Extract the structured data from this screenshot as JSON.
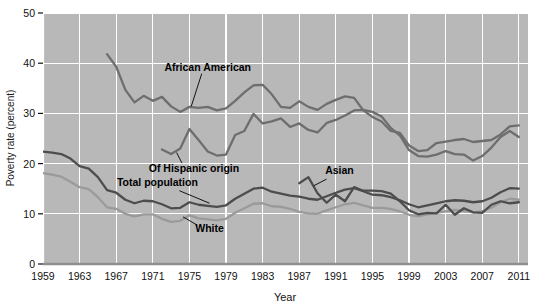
{
  "chart_data": {
    "type": "line",
    "title": "",
    "xlabel": "Year",
    "ylabel": "Poverty rate (percent)",
    "xlim": [
      1959,
      2012
    ],
    "ylim": [
      0,
      50
    ],
    "yticks": [
      0,
      10,
      20,
      30,
      40,
      50
    ],
    "ytick_labels": [
      "0",
      "10",
      "20",
      "30",
      "40",
      "50"
    ],
    "xticks": [
      1959,
      1963,
      1967,
      1971,
      1975,
      1979,
      1983,
      1987,
      1991,
      1995,
      1999,
      2003,
      2007,
      2011
    ],
    "xtick_labels": [
      "1959",
      "1963",
      "1967",
      "1971",
      "1975",
      "1979",
      "1983",
      "1987",
      "1991",
      "1995",
      "1999",
      "2003",
      "2007",
      "2011"
    ],
    "grid": true,
    "grid_color": "#ffffff",
    "plot_background": "#b8b8b8",
    "legend_position": "inline-annotations",
    "series": [
      {
        "name": "African American",
        "color": "#6e6e6e",
        "label_x": 1977,
        "label_y": 38.5,
        "x": [
          1966,
          1967,
          1968,
          1969,
          1970,
          1971,
          1972,
          1973,
          1974,
          1975,
          1976,
          1977,
          1978,
          1979,
          1980,
          1981,
          1982,
          1983,
          1984,
          1985,
          1986,
          1987,
          1988,
          1989,
          1990,
          1991,
          1992,
          1993,
          1994,
          1995,
          1996,
          1997,
          1998,
          1999,
          2000,
          2001,
          2002,
          2003,
          2004,
          2005,
          2006,
          2007,
          2008,
          2009,
          2010,
          2011
        ],
        "values": [
          41.8,
          39.3,
          34.7,
          32.2,
          33.5,
          32.5,
          33.3,
          31.4,
          30.3,
          31.3,
          31.1,
          31.3,
          30.6,
          31.0,
          32.5,
          34.2,
          35.6,
          35.7,
          33.8,
          31.3,
          31.1,
          32.4,
          31.3,
          30.7,
          31.9,
          32.7,
          33.4,
          33.1,
          30.6,
          29.3,
          28.4,
          26.5,
          26.1,
          23.6,
          22.5,
          22.7,
          24.1,
          24.4,
          24.7,
          24.9,
          24.3,
          24.5,
          24.7,
          25.8,
          27.4,
          27.6
        ]
      },
      {
        "name": "Of Hispanic origin",
        "color": "#6e6e6e",
        "label_x": 1974.5,
        "label_y": 19.0,
        "x": [
          1972,
          1973,
          1974,
          1975,
          1976,
          1977,
          1978,
          1979,
          1980,
          1981,
          1982,
          1983,
          1984,
          1985,
          1986,
          1987,
          1988,
          1989,
          1990,
          1991,
          1992,
          1993,
          1994,
          1995,
          1996,
          1997,
          1998,
          1999,
          2000,
          2001,
          2002,
          2003,
          2004,
          2005,
          2006,
          2007,
          2008,
          2009,
          2010,
          2011
        ],
        "values": [
          22.8,
          21.9,
          23.0,
          26.9,
          24.7,
          22.4,
          21.6,
          21.8,
          25.7,
          26.5,
          29.9,
          28.0,
          28.4,
          29.0,
          27.3,
          28.0,
          26.7,
          26.2,
          28.1,
          28.7,
          29.6,
          30.6,
          30.7,
          30.3,
          29.4,
          27.1,
          25.6,
          22.7,
          21.5,
          21.4,
          21.8,
          22.5,
          21.9,
          21.8,
          20.6,
          21.5,
          23.2,
          25.3,
          26.5,
          25.3
        ]
      },
      {
        "name": "Total population",
        "color": "#4d4d4d",
        "label_x": 1970,
        "label_y": 15.2,
        "x": [
          1959,
          1960,
          1961,
          1962,
          1963,
          1964,
          1965,
          1966,
          1967,
          1968,
          1969,
          1970,
          1971,
          1972,
          1973,
          1974,
          1975,
          1976,
          1977,
          1978,
          1979,
          1980,
          1981,
          1982,
          1983,
          1984,
          1985,
          1986,
          1987,
          1988,
          1989,
          1990,
          1991,
          1992,
          1993,
          1994,
          1995,
          1996,
          1997,
          1998,
          1999,
          2000,
          2001,
          2002,
          2003,
          2004,
          2005,
          2006,
          2007,
          2008,
          2009,
          2010,
          2011
        ],
        "values": [
          22.4,
          22.2,
          21.9,
          21.0,
          19.5,
          19.0,
          17.3,
          14.7,
          14.2,
          12.8,
          12.1,
          12.6,
          12.5,
          11.9,
          11.1,
          11.2,
          12.3,
          11.8,
          11.6,
          11.4,
          11.7,
          13.0,
          14.0,
          15.0,
          15.2,
          14.4,
          14.0,
          13.6,
          13.4,
          13.0,
          12.8,
          13.5,
          14.2,
          14.8,
          15.1,
          14.5,
          13.8,
          13.7,
          13.3,
          12.7,
          11.9,
          11.3,
          11.7,
          12.1,
          12.5,
          12.7,
          12.6,
          12.3,
          12.5,
          13.2,
          14.3,
          15.1,
          15.0
        ]
      },
      {
        "name": "White",
        "color": "#9a9a9a",
        "label_x": 1976,
        "label_y": 6.8,
        "x": [
          1959,
          1960,
          1961,
          1962,
          1963,
          1964,
          1965,
          1966,
          1967,
          1968,
          1969,
          1970,
          1971,
          1972,
          1973,
          1974,
          1975,
          1976,
          1977,
          1978,
          1979,
          1980,
          1981,
          1982,
          1983,
          1984,
          1985,
          1986,
          1987,
          1988,
          1989,
          1990,
          1991,
          1992,
          1993,
          1994,
          1995,
          1996,
          1997,
          1998,
          1999,
          2000,
          2001,
          2002,
          2003,
          2004,
          2005,
          2006,
          2007,
          2008,
          2009,
          2010,
          2011
        ],
        "values": [
          18.1,
          17.8,
          17.4,
          16.4,
          15.3,
          14.9,
          13.3,
          11.3,
          11.0,
          10.0,
          9.5,
          9.9,
          9.9,
          9.0,
          8.4,
          8.6,
          9.7,
          9.1,
          8.9,
          8.7,
          9.0,
          10.2,
          11.1,
          12.0,
          12.1,
          11.5,
          11.4,
          11.0,
          10.4,
          10.1,
          10.0,
          10.7,
          11.3,
          11.9,
          12.2,
          11.7,
          11.2,
          11.2,
          11.0,
          10.5,
          9.8,
          9.5,
          9.9,
          10.2,
          10.5,
          10.8,
          10.6,
          10.3,
          10.5,
          11.2,
          12.3,
          13.0,
          12.8
        ]
      },
      {
        "name": "Asian",
        "color": "#4d4d4d",
        "label_x": 1991,
        "label_y": 17.4,
        "x": [
          1987,
          1988,
          1989,
          1990,
          1991,
          1992,
          1993,
          1994,
          1995,
          1996,
          1997,
          1998,
          1999,
          2000,
          2001,
          2002,
          2003,
          2004,
          2005,
          2006,
          2007,
          2008,
          2009,
          2010,
          2011
        ],
        "values": [
          16.1,
          17.3,
          14.1,
          12.2,
          13.8,
          12.5,
          15.3,
          14.6,
          14.6,
          14.5,
          14.0,
          12.5,
          10.7,
          9.9,
          10.2,
          10.1,
          11.8,
          9.8,
          11.1,
          10.3,
          10.2,
          11.8,
          12.5,
          12.1,
          12.3
        ]
      }
    ]
  }
}
